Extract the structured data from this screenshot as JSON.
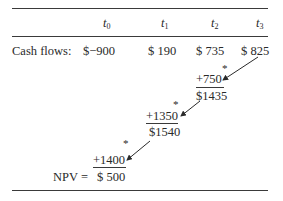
{
  "table": {
    "headers": [
      {
        "var": "t",
        "sub": "0"
      },
      {
        "var": "t",
        "sub": "1"
      },
      {
        "var": "t",
        "sub": "2"
      },
      {
        "var": "t",
        "sub": "3"
      }
    ],
    "row_label": "Cash flows:",
    "cash_flows": [
      "$−900",
      "$ 190",
      "$ 735",
      "$ 825"
    ]
  },
  "steps": [
    {
      "marker": "*",
      "addend": "+750",
      "result": "$1435"
    },
    {
      "marker": "*",
      "addend": "+1350",
      "result": "$1540"
    },
    {
      "marker": "*",
      "addend": "+1400",
      "result": "$ 500"
    }
  ],
  "npv_label": "NPV ="
}
